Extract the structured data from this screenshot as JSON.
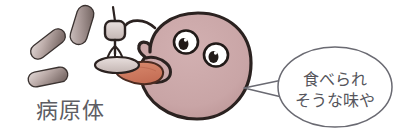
{
  "illustration": {
    "title": "pathogen-and-creature-illustration",
    "canvas": {
      "width": 401,
      "height": 137,
      "background": "#ffffff"
    },
    "labels": {
      "pathogen_label": "病原体"
    },
    "speech_bubble": {
      "line1": "食べられ",
      "line2": "そうな味や"
    },
    "pathogens": [
      {
        "name": "bacterium-upper-left",
        "cx": 48,
        "cy": 44,
        "rx": 20,
        "ry": 7.5,
        "rotation": -38
      },
      {
        "name": "bacterium-upper-right",
        "cx": 82,
        "cy": 25,
        "rx": 20,
        "ry": 8.5,
        "rotation": -72
      },
      {
        "name": "bacterium-lower-left",
        "cx": 48,
        "cy": 77,
        "rx": 20,
        "ry": 7.5,
        "rotation": -12
      }
    ],
    "colors": {
      "body_fill": "#c9a5a6",
      "body_outline": "#2b2220",
      "tongue_fill": "#cf7b62",
      "tongue_outline": "#4a2a20",
      "bacteria_light": "#ded5d4",
      "bacteria_dark": "#8a7976",
      "bacteria_outline": "#3a3230",
      "probe_fill": "#ded1cf",
      "probe_outline": "#2b2220",
      "bubble_outline": "#6a6a72",
      "bubble_fill": "#ffffff",
      "eye_white": "#ffffff",
      "eye_pupil": "#211a18",
      "label_color": "#5d5d63",
      "bubble_text_color": "#55555c"
    }
  }
}
